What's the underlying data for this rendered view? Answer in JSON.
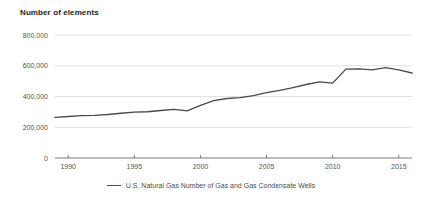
{
  "chart_data": {
    "type": "line",
    "title": "Number of elements",
    "xlabel": "",
    "ylabel": "",
    "ylim": [
      0,
      800000
    ],
    "xlim": [
      1989,
      2016
    ],
    "grid": true,
    "legend_position": "bottom",
    "ytick_labels": [
      "800,000",
      "600,000",
      "400,000",
      "200,000",
      "0"
    ],
    "ytick_values": [
      800000,
      600000,
      400000,
      200000,
      0
    ],
    "xtick_labels": [
      "1990",
      "1995",
      "2000",
      "2005",
      "2010",
      "2015"
    ],
    "xtick_values": [
      1990,
      1995,
      2000,
      2005,
      2010,
      2015
    ],
    "line_color": "#4a4a4a",
    "grid_color": "#d9d9d9",
    "axis_color": "#6b6b6b",
    "series": [
      {
        "name": "U.S. Natural Gas Number of Gas and Gas Condensate Wells",
        "x": [
          1989,
          1990,
          1991,
          1992,
          1993,
          1994,
          1995,
          1996,
          1997,
          1998,
          1999,
          2000,
          2001,
          2002,
          2003,
          2004,
          2005,
          2006,
          2007,
          2008,
          2009,
          2010,
          2011,
          2012,
          2013,
          2014,
          2015,
          2016
        ],
        "values": [
          264000,
          270000,
          276000,
          277000,
          283000,
          291000,
          298000,
          301000,
          309000,
          316000,
          306000,
          342000,
          373000,
          387000,
          393000,
          406000,
          425000,
          440000,
          458000,
          478000,
          495000,
          487000,
          578000,
          580000,
          573000,
          588000,
          573000,
          553000
        ]
      }
    ]
  },
  "legend": {
    "entries": [
      {
        "label": "U.S. Natural Gas Number of Gas and Gas Condensate Wells",
        "color": "#4a4a4a"
      }
    ]
  }
}
